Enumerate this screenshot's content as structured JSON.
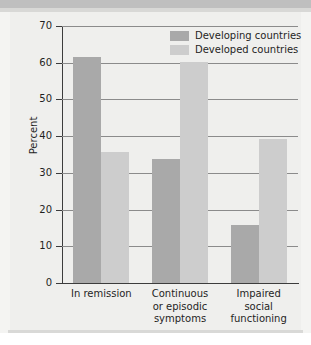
{
  "chart_data": {
    "type": "bar",
    "title": "",
    "xlabel": "",
    "ylabel": "Percent",
    "ylim": [
      0,
      70
    ],
    "ytick_step": 10,
    "yticks": [
      70,
      60,
      50,
      40,
      30,
      20,
      10,
      0
    ],
    "ytick_labels": [
      "70",
      "60",
      "50",
      "40",
      "30",
      "20",
      "10",
      "0"
    ],
    "grid": true,
    "legend_position": "top-right",
    "categories": [
      "In remission",
      "Continuous or episodic symptoms",
      "Impaired social functioning"
    ],
    "category_lines": [
      [
        "In remission"
      ],
      [
        "Continuous",
        "or episodic",
        "symptoms"
      ],
      [
        "Impaired",
        "social",
        "functioning"
      ]
    ],
    "series": [
      {
        "name": "Developing countries",
        "color": "#a9a9a9",
        "values": [
          61.5,
          33.8,
          15.8
        ]
      },
      {
        "name": "Developed countries",
        "color": "#cdcdcd",
        "values": [
          35.6,
          60.2,
          39.3
        ]
      }
    ]
  },
  "legend": {
    "items": [
      {
        "label": "Developing countries",
        "swatch": "legend-swatch-developing"
      },
      {
        "label": "Developed countries",
        "swatch": "legend-swatch-developed"
      }
    ]
  },
  "axis": {
    "y_title": "Percent"
  },
  "colors": {
    "series_developing": "#a9a9a9",
    "series_developed": "#cdcdcd",
    "gridline": "#8b8b8b",
    "axis": "#3c3c3c",
    "panel_background": "#efefed",
    "page_background": "#f4f4f2"
  }
}
